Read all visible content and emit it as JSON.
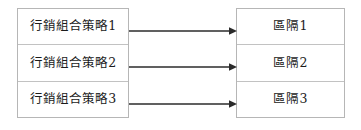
{
  "diagram": {
    "background_color": "#ffffff",
    "box_border_color": "#b6b6b6",
    "row_divider_color": "#c2c2c2",
    "text_color": "#1b1b1b",
    "arrow_color": "#2b2b2b",
    "left_group": {
      "name": "行銷組合策略",
      "rows": [
        {
          "label": "行銷組合策略1"
        },
        {
          "label": "行銷組合策略2"
        },
        {
          "label": "行銷組合策略3"
        }
      ]
    },
    "right_group": {
      "name": "區隔",
      "rows": [
        {
          "label": "區隔1"
        },
        {
          "label": "區隔2"
        },
        {
          "label": "區隔3"
        }
      ]
    },
    "connectors": [
      {
        "id": "arrow-1",
        "from": "行銷組合策略1",
        "to": "區隔1",
        "icon": "arrow-right-icon"
      },
      {
        "id": "arrow-2",
        "from": "行銷組合策略2",
        "to": "區隔2",
        "icon": "arrow-right-icon"
      },
      {
        "id": "arrow-3",
        "from": "行銷組合策略3",
        "to": "區隔3",
        "icon": "arrow-right-icon"
      }
    ]
  }
}
